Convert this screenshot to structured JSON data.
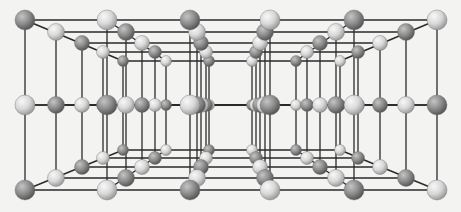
{
  "diagram": {
    "type": "crystal-lattice-perspective",
    "colors": {
      "background": "#f3f3f1",
      "bond": "#2a2a2a",
      "dark_atom": "#8c8c8c",
      "dark_atom_highlight": "#c4c4c4",
      "dark_atom_shadow": "#555555",
      "light_atom": "#d8d8d8",
      "light_atom_highlight": "#f8f8f8",
      "light_atom_shadow": "#9a9a9a"
    },
    "rows_y_front": [
      20,
      105,
      190
    ],
    "depth_layers": 5,
    "columns": [
      {
        "x": [
          25,
          56,
          82,
          103,
          123
        ],
        "first_type": "dark"
      },
      {
        "x": [
          107,
          126,
          142,
          155,
          166
        ],
        "first_type": "light"
      },
      {
        "x": [
          190,
          197,
          201,
          206,
          209
        ],
        "first_type": "dark"
      },
      {
        "x": [
          270,
          265,
          260,
          256,
          252
        ],
        "first_type": "light"
      },
      {
        "x": [
          354,
          336,
          320,
          307,
          296
        ],
        "first_type": "dark"
      },
      {
        "x": [
          437,
          406,
          380,
          358,
          340
        ],
        "first_type": "light"
      }
    ],
    "layer_y_offsets_top": [
      20,
      32,
      43,
      52,
      61
    ],
    "layer_y_offsets_mid": [
      105,
      105,
      105,
      105,
      105
    ],
    "layer_y_offsets_bottom": [
      190,
      178,
      167,
      158,
      150
    ],
    "layer_radii": [
      10,
      8.5,
      7.5,
      6.5,
      5.5
    ]
  }
}
